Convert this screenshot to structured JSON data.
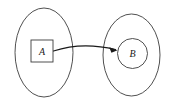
{
  "diagram": {
    "type": "set-mapping-diagram",
    "background_color": "#ffffff",
    "stroke_color": "#3c3c3c",
    "arrow_color": "#1a1a1a",
    "source_set": {
      "shape": "ellipse",
      "element": {
        "shape": "square",
        "label": "A"
      }
    },
    "target_set": {
      "shape": "ellipse",
      "element": {
        "shape": "circle",
        "label": "B"
      }
    },
    "arrow": {
      "from": "A",
      "to": "B",
      "style": "curved-with-arrowhead"
    }
  }
}
